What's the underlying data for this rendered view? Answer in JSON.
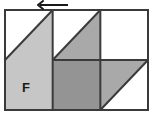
{
  "figure": {
    "name": "tangram-dissection-figure",
    "description": "Rectangle divided into a 3 by 2 grid of square cells with shaded triangular and square regions, and a leftward arrow above the top edge.",
    "canvas": {
      "width": 153,
      "height": 120,
      "background": "#ffffff"
    },
    "rect": {
      "x": 5,
      "y": 10,
      "width": 143,
      "height": 100,
      "columns": 3,
      "rows": 2,
      "cell_width": 47.67,
      "cell_height": 50
    },
    "colors": {
      "outline": "#3a3a3a",
      "light_gray": "#c6c6c6",
      "medium_gray": "#a9a9a9",
      "dark_gray": "#949494",
      "white": "#ffffff",
      "label": "#1a1a1a",
      "arrow": "#1a1a1a"
    },
    "label": {
      "text": "F",
      "x": 26,
      "y": 92,
      "font_size": 13,
      "font_weight": "bold"
    },
    "arrow": {
      "name": "left-arrow",
      "direction": "left",
      "tail_x": 68,
      "head_x": 38,
      "y": 5,
      "head_size": 5,
      "stroke_width": 2
    },
    "cells": [
      {
        "name": "cell-top-left",
        "row": 0,
        "col": 0,
        "fill": "half-lower-right",
        "color": "#c6c6c6"
      },
      {
        "name": "cell-top-middle",
        "row": 0,
        "col": 1,
        "fill": "half-lower-right",
        "color": "#a9a9a9"
      },
      {
        "name": "cell-top-right",
        "row": 0,
        "col": 2,
        "fill": "empty",
        "color": "#ffffff"
      },
      {
        "name": "cell-bottom-left",
        "row": 1,
        "col": 0,
        "fill": "full",
        "color": "#c6c6c6"
      },
      {
        "name": "cell-bottom-middle",
        "row": 1,
        "col": 1,
        "fill": "full",
        "color": "#949494"
      },
      {
        "name": "cell-bottom-right",
        "row": 1,
        "col": 2,
        "fill": "half-upper-left",
        "color": "#a9a9a9"
      }
    ],
    "grid_lines": [
      {
        "name": "vertical-divider-1",
        "x1": 52.67,
        "y1": 10,
        "x2": 52.67,
        "y2": 110
      },
      {
        "name": "vertical-divider-2",
        "x1": 100.33,
        "y1": 10,
        "x2": 100.33,
        "y2": 110
      },
      {
        "name": "horizontal-divider",
        "x1": 52.67,
        "y1": 60,
        "x2": 148,
        "y2": 60
      }
    ],
    "diagonals": [
      {
        "name": "diagonal-top-left",
        "x1": 5,
        "y1": 60,
        "x2": 52.67,
        "y2": 10
      },
      {
        "name": "diagonal-top-middle",
        "x1": 52.67,
        "y1": 60,
        "x2": 100.33,
        "y2": 10
      },
      {
        "name": "diagonal-bottom-right",
        "x1": 100.33,
        "y1": 110,
        "x2": 148,
        "y2": 60
      }
    ]
  }
}
